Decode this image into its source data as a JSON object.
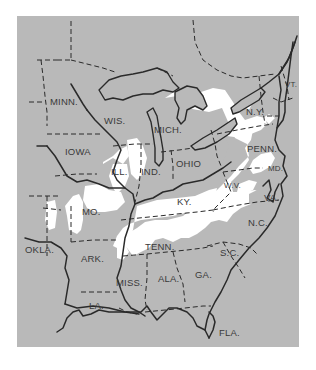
{
  "map": {
    "type": "thematic-region-map",
    "region": "Eastern United States",
    "colors": {
      "background": "#ffffff",
      "land": "#b9b9b9",
      "highlight_region": "#ffffff",
      "boundary_lines": "#2a2a2a",
      "label_text": "#3a3a3a"
    },
    "legend": {
      "highlighted_area": "white patches (shaded region of interest)",
      "state_borders": "dashed lines",
      "rivers_and_coastlines": "solid lines"
    },
    "state_labels": [
      {
        "id": "minn",
        "text": "MINN."
      },
      {
        "id": "wis",
        "text": "WIS."
      },
      {
        "id": "mich",
        "text": "MICH."
      },
      {
        "id": "ny",
        "text": "N.Y."
      },
      {
        "id": "vt",
        "text": "VT."
      },
      {
        "id": "iowa",
        "text": "IOWA"
      },
      {
        "id": "ill",
        "text": "ILL."
      },
      {
        "id": "ind",
        "text": "IND."
      },
      {
        "id": "ohio",
        "text": "OHIO"
      },
      {
        "id": "penn",
        "text": "PENN."
      },
      {
        "id": "md",
        "text": "MD."
      },
      {
        "id": "wv",
        "text": "W.V."
      },
      {
        "id": "va",
        "text": "VA."
      },
      {
        "id": "mo",
        "text": "MO."
      },
      {
        "id": "ky",
        "text": "KY."
      },
      {
        "id": "nc",
        "text": "N.C."
      },
      {
        "id": "okla",
        "text": "OKLA."
      },
      {
        "id": "tenn",
        "text": "TENN."
      },
      {
        "id": "ark",
        "text": "ARK."
      },
      {
        "id": "sc",
        "text": "S.C."
      },
      {
        "id": "ala",
        "text": "ALA."
      },
      {
        "id": "ga",
        "text": "GA."
      },
      {
        "id": "miss",
        "text": "MISS."
      },
      {
        "id": "la",
        "text": "LA."
      },
      {
        "id": "fla",
        "text": "FLA."
      }
    ]
  }
}
